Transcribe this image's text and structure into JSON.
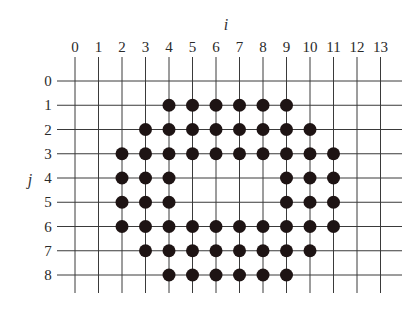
{
  "diagram": {
    "type": "lattice-grid",
    "x_axis": {
      "label": "i",
      "ticks": [
        "0",
        "1",
        "2",
        "3",
        "4",
        "5",
        "6",
        "7",
        "8",
        "9",
        "10",
        "11",
        "12",
        "13"
      ]
    },
    "y_axis": {
      "label": "j",
      "ticks": [
        "0",
        "1",
        "2",
        "3",
        "4",
        "5",
        "6",
        "7",
        "8"
      ]
    },
    "colors": {
      "line": "#3a3a3a",
      "dot": "#1e1414",
      "text": "#2a2a2a",
      "background": "#ffffff"
    },
    "points_by_row": [
      {
        "j": 0,
        "i": []
      },
      {
        "j": 1,
        "i": [
          4,
          5,
          6,
          7,
          8,
          9
        ]
      },
      {
        "j": 2,
        "i": [
          3,
          4,
          5,
          6,
          7,
          8,
          9,
          10
        ]
      },
      {
        "j": 3,
        "i": [
          2,
          3,
          4,
          5,
          6,
          7,
          8,
          9,
          10,
          11
        ]
      },
      {
        "j": 4,
        "i": [
          2,
          3,
          4,
          9,
          10,
          11
        ]
      },
      {
        "j": 5,
        "i": [
          2,
          3,
          4,
          9,
          10,
          11
        ]
      },
      {
        "j": 6,
        "i": [
          2,
          3,
          4,
          5,
          6,
          7,
          8,
          9,
          10,
          11
        ]
      },
      {
        "j": 7,
        "i": [
          3,
          4,
          5,
          6,
          7,
          8,
          9,
          10
        ]
      },
      {
        "j": 8,
        "i": [
          4,
          5,
          6,
          7,
          8,
          9
        ]
      }
    ]
  }
}
